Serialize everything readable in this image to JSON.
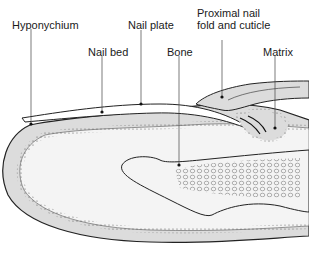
{
  "diagram": {
    "type": "anatomical-cross-section",
    "labels": [
      {
        "id": "hyponychium",
        "text": "Hyponychium"
      },
      {
        "id": "nail_plate",
        "text": "Nail plate"
      },
      {
        "id": "nail_bed",
        "text": "Nail bed"
      },
      {
        "id": "proximal_nail_fold",
        "text": "Proximal nail\nfold and cuticle"
      },
      {
        "id": "bone",
        "text": "Bone"
      },
      {
        "id": "matrix",
        "text": "Matrix"
      }
    ],
    "colors": {
      "outline": "#222222",
      "tissue_fill": "#dcdcdc",
      "inner_fill": "#f4f4f4",
      "leader_line": "#444444",
      "background": "#ffffff"
    }
  }
}
